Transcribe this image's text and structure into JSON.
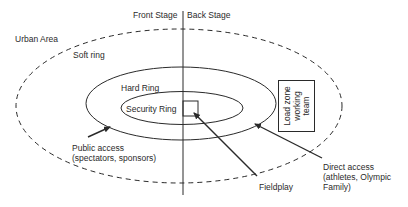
{
  "diagram": {
    "divider": {
      "left_label": "Front Stage",
      "right_label": "Back Stage"
    },
    "rings": [
      {
        "id": "urban",
        "label": "Urban Area",
        "style": "none"
      },
      {
        "id": "soft",
        "label": "Soft ring",
        "style": "dashed"
      },
      {
        "id": "hard",
        "label": "Hard Ring",
        "style": "solid"
      },
      {
        "id": "security",
        "label": "Security Ring",
        "style": "solid"
      }
    ],
    "load_zone": {
      "line1": "Load zone",
      "line2": "working",
      "line3": "team"
    },
    "annotations": {
      "public_access": {
        "line1": "Public access",
        "line2": "(spectators, sponsors)"
      },
      "fieldplay": {
        "label": "Fieldplay"
      },
      "direct_access": {
        "line1": "Direct access",
        "line2": "(athletes, Olympic",
        "line3": "Family)"
      }
    },
    "colors": {
      "stroke": "#2a2a2a",
      "background": "#ffffff"
    }
  }
}
